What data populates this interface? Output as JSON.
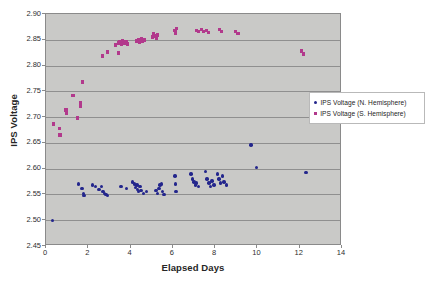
{
  "chart_data": {
    "type": "scatter",
    "title": "",
    "xlabel": "Elapsed Days",
    "ylabel": "IPS Voltage",
    "xlim": [
      0,
      14
    ],
    "ylim": [
      2.45,
      2.9
    ],
    "xticks": [
      0,
      2,
      4,
      6,
      8,
      10,
      12,
      14
    ],
    "xtick_labels": [
      "0",
      "2",
      "4",
      "6",
      "8",
      "10",
      "12",
      "14"
    ],
    "yticks": [
      2.45,
      2.5,
      2.55,
      2.6,
      2.65,
      2.7,
      2.75,
      2.8,
      2.85,
      2.9
    ],
    "ytick_labels": [
      "2.45",
      "2.50",
      "2.55",
      "2.60",
      "2.65",
      "2.70",
      "2.75",
      "2.80",
      "2.85",
      "2.90"
    ],
    "grid": "horizontal",
    "legend_position": "center-right",
    "plot_background": "#c9c9c7",
    "series": [
      {
        "name": "IPS Voltage (N. Hemisphere)",
        "color": "#23268c",
        "marker": "circle",
        "points": [
          [
            0.3,
            2.5
          ],
          [
            1.55,
            2.57
          ],
          [
            1.7,
            2.562
          ],
          [
            1.78,
            2.552
          ],
          [
            1.8,
            2.548
          ],
          [
            2.2,
            2.568
          ],
          [
            2.35,
            2.565
          ],
          [
            2.5,
            2.56
          ],
          [
            2.62,
            2.566
          ],
          [
            2.7,
            2.556
          ],
          [
            2.78,
            2.552
          ],
          [
            2.84,
            2.55
          ],
          [
            2.9,
            2.548
          ],
          [
            3.55,
            2.566
          ],
          [
            3.8,
            2.562
          ],
          [
            4.1,
            2.574
          ],
          [
            4.18,
            2.57
          ],
          [
            4.22,
            2.563
          ],
          [
            4.3,
            2.568
          ],
          [
            4.34,
            2.56
          ],
          [
            4.38,
            2.556
          ],
          [
            4.44,
            2.566
          ],
          [
            4.5,
            2.558
          ],
          [
            4.62,
            2.552
          ],
          [
            4.76,
            2.556
          ],
          [
            5.2,
            2.558
          ],
          [
            5.28,
            2.552
          ],
          [
            5.34,
            2.562
          ],
          [
            5.4,
            2.568
          ],
          [
            5.46,
            2.57
          ],
          [
            5.52,
            2.556
          ],
          [
            5.58,
            2.55
          ],
          [
            6.1,
            2.586
          ],
          [
            6.12,
            2.57
          ],
          [
            6.14,
            2.556
          ],
          [
            6.85,
            2.59
          ],
          [
            6.92,
            2.58
          ],
          [
            7.0,
            2.574
          ],
          [
            7.06,
            2.568
          ],
          [
            7.12,
            2.572
          ],
          [
            7.2,
            2.566
          ],
          [
            7.55,
            2.594
          ],
          [
            7.62,
            2.58
          ],
          [
            7.7,
            2.572
          ],
          [
            7.78,
            2.566
          ],
          [
            7.86,
            2.576
          ],
          [
            7.95,
            2.568
          ],
          [
            8.1,
            2.59
          ],
          [
            8.18,
            2.58
          ],
          [
            8.26,
            2.572
          ],
          [
            8.34,
            2.586
          ],
          [
            8.42,
            2.574
          ],
          [
            8.55,
            2.568
          ],
          [
            9.7,
            2.646
          ],
          [
            9.95,
            2.602
          ],
          [
            12.3,
            2.592
          ]
        ]
      },
      {
        "name": "IPS Voltage (S. Hemisphere)",
        "color": "#b2398c",
        "marker": "square",
        "points": [
          [
            0.35,
            2.686
          ],
          [
            0.62,
            2.678
          ],
          [
            0.66,
            2.666
          ],
          [
            0.95,
            2.714
          ],
          [
            0.98,
            2.708
          ],
          [
            1.28,
            2.742
          ],
          [
            1.48,
            2.698
          ],
          [
            1.62,
            2.728
          ],
          [
            1.64,
            2.722
          ],
          [
            1.72,
            2.768
          ],
          [
            2.68,
            2.818
          ],
          [
            2.92,
            2.826
          ],
          [
            3.3,
            2.84
          ],
          [
            3.42,
            2.844
          ],
          [
            3.5,
            2.846
          ],
          [
            3.56,
            2.842
          ],
          [
            3.62,
            2.848
          ],
          [
            3.7,
            2.844
          ],
          [
            3.78,
            2.846
          ],
          [
            3.86,
            2.842
          ],
          [
            3.44,
            2.824
          ],
          [
            4.3,
            2.848
          ],
          [
            4.38,
            2.85
          ],
          [
            4.44,
            2.846
          ],
          [
            4.5,
            2.852
          ],
          [
            4.56,
            2.848
          ],
          [
            4.64,
            2.85
          ],
          [
            5.05,
            2.856
          ],
          [
            5.1,
            2.862
          ],
          [
            5.16,
            2.858
          ],
          [
            5.22,
            2.854
          ],
          [
            5.28,
            2.86
          ],
          [
            6.1,
            2.868
          ],
          [
            6.14,
            2.862
          ],
          [
            6.18,
            2.872
          ],
          [
            7.1,
            2.868
          ],
          [
            7.22,
            2.866
          ],
          [
            7.34,
            2.87
          ],
          [
            7.46,
            2.866
          ],
          [
            7.58,
            2.868
          ],
          [
            7.7,
            2.864
          ],
          [
            8.2,
            2.87
          ],
          [
            8.3,
            2.866
          ],
          [
            8.95,
            2.866
          ],
          [
            9.08,
            2.862
          ],
          [
            12.1,
            2.828
          ],
          [
            12.16,
            2.822
          ]
        ]
      }
    ]
  },
  "legend": {
    "items": [
      {
        "label": "IPS Voltage (N. Hemisphere)",
        "color": "#23268c",
        "marker": "circle"
      },
      {
        "label": "IPS Voltage (S. Hemisphere)",
        "color": "#b2398c",
        "marker": "square"
      }
    ]
  }
}
